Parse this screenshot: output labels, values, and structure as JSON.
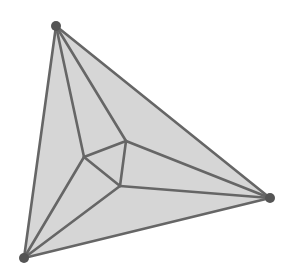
{
  "diagram": {
    "type": "planar-graph-triangulation",
    "colors": {
      "background": "#ffffff",
      "fill": "#d6d6d6",
      "edge": "#666666",
      "vertex": "#555555"
    },
    "outer_vertices": [
      {
        "id": "top",
        "x": 56,
        "y": 26
      },
      {
        "id": "right",
        "x": 270,
        "y": 198
      },
      {
        "id": "bottom-left",
        "x": 24,
        "y": 258
      }
    ],
    "inner_vertices": [
      {
        "id": "inner-left",
        "x": 84,
        "y": 157
      },
      {
        "id": "inner-top-right",
        "x": 126,
        "y": 141
      },
      {
        "id": "inner-bottom",
        "x": 120,
        "y": 186
      }
    ],
    "edges": [
      [
        "top",
        "right"
      ],
      [
        "right",
        "bottom-left"
      ],
      [
        "bottom-left",
        "top"
      ],
      [
        "inner-left",
        "inner-top-right"
      ],
      [
        "inner-top-right",
        "inner-bottom"
      ],
      [
        "inner-bottom",
        "inner-left"
      ],
      [
        "top",
        "inner-left"
      ],
      [
        "top",
        "inner-top-right"
      ],
      [
        "right",
        "inner-top-right"
      ],
      [
        "right",
        "inner-bottom"
      ],
      [
        "bottom-left",
        "inner-left"
      ],
      [
        "bottom-left",
        "inner-bottom"
      ]
    ]
  }
}
